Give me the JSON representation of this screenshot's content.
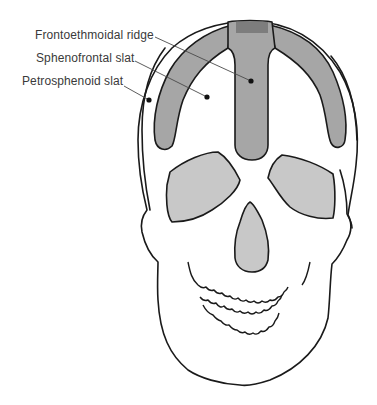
{
  "figure": {
    "type": "anatomical-diagram",
    "labels": [
      {
        "id": "frontoethmoidal",
        "text": "Frontoethmoidal ridge",
        "x": 35,
        "y": 28
      },
      {
        "id": "sphenofrontal",
        "text": "Sphenofrontal slat",
        "x": 36,
        "y": 51
      },
      {
        "id": "petrosphenoid",
        "text": "Petrosphenoid slat",
        "x": 22,
        "y": 74
      }
    ],
    "colors": {
      "outline": "#1a1a1a",
      "slat_fill": "#a6a6a6",
      "ridge_cap": "#7d7d7d",
      "cavity_fill": "#c8c8c8",
      "background": "#ffffff",
      "label_text": "#3a3a3a"
    }
  }
}
